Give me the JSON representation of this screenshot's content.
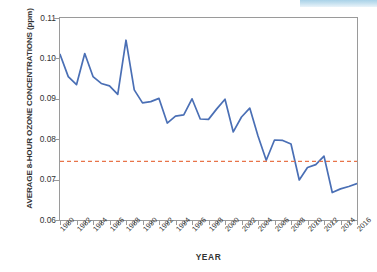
{
  "decor": {
    "top_band_color": "#a9d2e8"
  },
  "chart_data": {
    "type": "line",
    "title": "",
    "xlabel": "YEAR",
    "ylabel": "AVERAGE 8-HOUR OZONE CONCENTRATIONS (ppm)",
    "xlim": [
      1980,
      2016
    ],
    "ylim": [
      0.06,
      0.11
    ],
    "grid": false,
    "legend": "none",
    "y_ticks": [
      "0.11",
      "0.10",
      "0.09",
      "0.08",
      "0.07",
      "0.06"
    ],
    "y_tick_values": [
      0.11,
      0.1,
      0.09,
      0.08,
      0.07,
      0.06
    ],
    "x_tick_labels": [
      "1980",
      "1982",
      "1984",
      "1986",
      "1988",
      "1990",
      "1992",
      "1994",
      "1996",
      "1998",
      "2000",
      "2002",
      "2004",
      "2006",
      "2008",
      "2010",
      "2012",
      "2014",
      "2016"
    ],
    "x": [
      1980,
      1981,
      1982,
      1983,
      1984,
      1985,
      1986,
      1987,
      1988,
      1989,
      1990,
      1991,
      1992,
      1993,
      1994,
      1995,
      1996,
      1997,
      1998,
      1999,
      2000,
      2001,
      2002,
      2003,
      2004,
      2005,
      2006,
      2007,
      2008,
      2009,
      2010,
      2011,
      2012,
      2013,
      2014,
      2015,
      2016
    ],
    "series": [
      {
        "name": "Average 8-hour ozone concentration",
        "color": "#4a6fb5",
        "style": "solid",
        "values": [
          0.101,
          0.0955,
          0.0935,
          0.1012,
          0.0955,
          0.0938,
          0.0932,
          0.0911,
          0.1045,
          0.0922,
          0.089,
          0.0893,
          0.0901,
          0.084,
          0.0857,
          0.086,
          0.09,
          0.085,
          0.0849,
          0.0875,
          0.0899,
          0.0818,
          0.0855,
          0.0877,
          0.0808,
          0.0748,
          0.0798,
          0.0797,
          0.0788,
          0.0699,
          0.073,
          0.0737,
          0.0758,
          0.0668,
          0.0677,
          0.0683,
          0.069
        ]
      }
    ],
    "reference_line": {
      "name": "standard-threshold",
      "value": 0.0745,
      "color": "#e8744a",
      "style": "dashed"
    }
  }
}
